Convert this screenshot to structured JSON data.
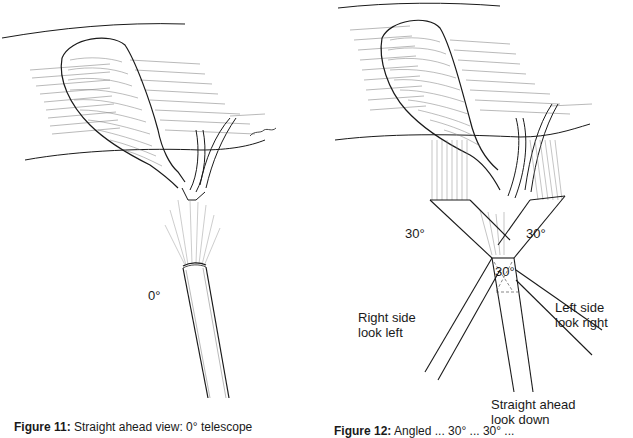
{
  "figures": [
    {
      "id": "left",
      "caption_label": "Figure 11:",
      "caption_text": "Straight ahead view: 0° telescope",
      "angle_label": "0°",
      "signature": "signature"
    },
    {
      "id": "right",
      "caption_label": "Figure 12:",
      "caption_text": "Angled ... 30° ... 30° ...",
      "angle_labels": {
        "left": "30°",
        "right": "30°",
        "center": "30°"
      },
      "view_labels": {
        "right_side_line1": "Right side",
        "right_side_line2": "look left",
        "left_side_line1": "Left side",
        "left_side_line2": "look right",
        "straight_line1": "Straight ahead",
        "straight_line2": "look down"
      }
    }
  ],
  "colors": {
    "ink": "#1a1a1a",
    "hatch": "#7a7a7a",
    "background": "#ffffff"
  }
}
